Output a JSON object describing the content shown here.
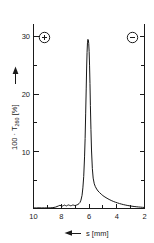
{
  "figure": {
    "background_color": "#ffffff",
    "ink_color": "#1a1a1a"
  },
  "annotations": {
    "anode_symbol": "+",
    "cathode_symbol": "−",
    "anode_name": "anode-polarity-marker",
    "cathode_name": "cathode-polarity-marker"
  },
  "chart_data": {
    "type": "line",
    "title": "",
    "subtitle": "",
    "xlabel": "s [mm]",
    "ylabel": "100 · T260 [%]",
    "ylabel_prefix": "100 · T",
    "ylabel_subscript": "260",
    "ylabel_unit": "[%]",
    "xlabel_symbol": "s",
    "xlabel_unit": "[mm]",
    "x_arrow_direction": "left",
    "y_arrow_direction": "up",
    "xlim": [
      10,
      2
    ],
    "ylim": [
      0,
      32
    ],
    "x_axis_reversed": true,
    "grid": false,
    "legend_position": "none",
    "xticks": [
      10,
      8,
      6,
      4,
      2
    ],
    "xtick_labels": [
      "10",
      "8",
      "6",
      "4",
      "2"
    ],
    "x_minor_ticks": [
      9,
      7,
      5,
      3
    ],
    "yticks": [
      10,
      20,
      30
    ],
    "ytick_labels": [
      "10",
      "20",
      "30"
    ],
    "y_minor_ticks": [
      5,
      15,
      25
    ],
    "peak": {
      "position_mm": 6.1,
      "height_percent": 29.5,
      "half_width_mm": 0.28
    },
    "series": [
      {
        "name": "T260 scan",
        "color": "#171717",
        "x": [
          10.0,
          9.8,
          9.6,
          9.4,
          9.2,
          9.0,
          8.8,
          8.6,
          8.4,
          8.2,
          8.1,
          8.0,
          7.92,
          7.85,
          7.78,
          7.7,
          7.62,
          7.55,
          7.48,
          7.4,
          7.32,
          7.25,
          7.18,
          7.1,
          7.02,
          6.95,
          6.88,
          6.8,
          6.72,
          6.65,
          6.58,
          6.5,
          6.44,
          6.38,
          6.32,
          6.28,
          6.24,
          6.2,
          6.17,
          6.14,
          6.11,
          6.08,
          6.05,
          6.02,
          5.99,
          5.96,
          5.93,
          5.9,
          5.86,
          5.82,
          5.76,
          5.7,
          5.62,
          5.54,
          5.45,
          5.35,
          5.25,
          5.12,
          5.0,
          4.85,
          4.7,
          4.55,
          4.4,
          4.25,
          4.1,
          3.95,
          3.8,
          3.65,
          3.5,
          3.35,
          3.2,
          3.05,
          2.9,
          2.75,
          2.6,
          2.45,
          2.3,
          2.15,
          2.0
        ],
        "y": [
          0.1,
          0.1,
          0.12,
          0.1,
          0.11,
          0.1,
          0.12,
          0.15,
          0.25,
          0.45,
          0.55,
          0.48,
          0.42,
          0.5,
          0.6,
          0.52,
          0.45,
          0.55,
          0.62,
          0.55,
          0.48,
          0.52,
          0.6,
          0.58,
          0.52,
          0.55,
          0.62,
          0.7,
          0.85,
          1.05,
          1.45,
          2.3,
          3.6,
          5.6,
          9.0,
          12.2,
          16.5,
          21.0,
          24.5,
          27.2,
          28.9,
          29.5,
          29.4,
          28.8,
          27.4,
          25.0,
          21.8,
          18.0,
          13.8,
          10.2,
          7.0,
          5.3,
          4.3,
          3.8,
          3.4,
          3.05,
          2.8,
          2.5,
          2.25,
          2.0,
          1.78,
          1.58,
          1.4,
          1.24,
          1.1,
          0.98,
          0.86,
          0.76,
          0.67,
          0.59,
          0.52,
          0.46,
          0.4,
          0.35,
          0.31,
          0.27,
          0.24,
          0.21,
          0.18
        ]
      }
    ]
  }
}
